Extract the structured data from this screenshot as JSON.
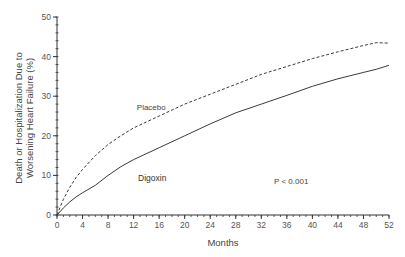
{
  "chart_data": {
    "type": "line",
    "title": "",
    "xlabel": "Months",
    "ylabel": "Death or Hospitalization Due to Worsening Heart Failure (%)",
    "ylabel_lines": [
      "Death or Hospitalization Due to",
      "Worsening Heart Failure (%)"
    ],
    "xlim": [
      0,
      52
    ],
    "ylim": [
      0,
      50
    ],
    "x_ticks": [
      0,
      4,
      8,
      12,
      16,
      20,
      24,
      28,
      32,
      36,
      40,
      44,
      48,
      52
    ],
    "y_ticks": [
      0,
      10,
      20,
      30,
      40,
      50
    ],
    "x_minor_step": 1,
    "y_minor_step": 2,
    "grid": false,
    "legend": "inline labels",
    "series": [
      {
        "name": "Placebo",
        "style": "dashed",
        "x": [
          0,
          1,
          2,
          3,
          4,
          6,
          8,
          10,
          12,
          16,
          20,
          24,
          28,
          32,
          36,
          40,
          44,
          48,
          50,
          52
        ],
        "values": [
          0,
          4.0,
          7.0,
          9.5,
          11.5,
          15.0,
          17.8,
          20.0,
          22.0,
          25.0,
          28.0,
          30.5,
          33.0,
          35.5,
          37.5,
          39.5,
          41.2,
          42.8,
          43.5,
          43.4
        ]
      },
      {
        "name": "Digoxin",
        "style": "solid",
        "x": [
          0,
          1,
          2,
          3,
          4,
          6,
          8,
          10,
          12,
          16,
          20,
          24,
          28,
          32,
          36,
          40,
          44,
          48,
          50,
          52
        ],
        "values": [
          0,
          1.8,
          3.3,
          4.6,
          5.6,
          7.5,
          10.0,
          12.2,
          14.0,
          17.0,
          20.0,
          23.0,
          25.8,
          28.0,
          30.2,
          32.5,
          34.4,
          36.0,
          36.8,
          37.8
        ]
      }
    ],
    "annotations": [
      {
        "text": "Placebo",
        "x": 12.5,
        "y": 26.5
      },
      {
        "text": "Digoxin",
        "x": 12.7,
        "y": 8.5
      },
      {
        "text": "P < 0.001",
        "x": 34,
        "y": 7.8
      }
    ]
  }
}
